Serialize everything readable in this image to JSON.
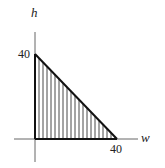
{
  "diagram": {
    "type": "triangular-region",
    "axes": {
      "vertical_label": "h",
      "horizontal_label": "w"
    },
    "ticks": {
      "h_intercept": "40",
      "w_intercept": "40"
    },
    "region": {
      "vertices": [
        [
          0,
          0
        ],
        [
          40,
          0
        ],
        [
          0,
          40
        ]
      ],
      "fill": "vertical-hatching",
      "hatch_color": "#222222",
      "edge_color": "#111111"
    }
  }
}
